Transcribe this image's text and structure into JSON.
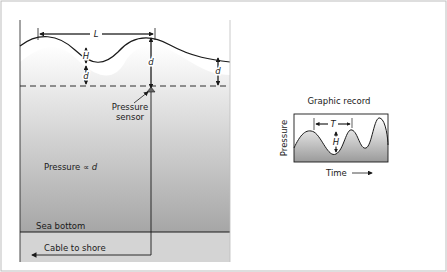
{
  "diagram": {
    "left_panel": {
      "wavelength_label": "L",
      "wave_height_label": "H",
      "depth_label": "d",
      "sensor_label_line1": "Pressure",
      "sensor_label_line2": "sensor",
      "pressure_relation_prefix": "Pressure ∝ ",
      "pressure_relation_var": "d",
      "sea_bottom_label": "Sea bottom",
      "cable_label": "Cable to shore"
    },
    "right_panel": {
      "title": "Graphic record",
      "period_label": "T",
      "height_label": "H",
      "y_axis_label": "Pressure",
      "x_axis_label": "Time"
    },
    "colors": {
      "frame_border": "#bdbdbd",
      "water_top": "#ffffff",
      "water_bottom": "#a6a6a6",
      "seabed": "#d4d4d4",
      "line": "#1a1a1a"
    }
  }
}
